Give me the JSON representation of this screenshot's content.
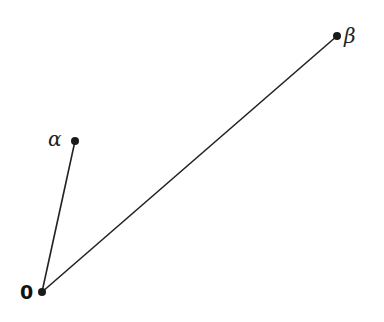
{
  "diagram": {
    "type": "vector-diagram",
    "stroke_color": "#222222",
    "points": {
      "origin": {
        "label": "0",
        "x": 42,
        "y": 292
      },
      "alpha": {
        "label": "α",
        "x": 75,
        "y": 141
      },
      "beta": {
        "label": "β",
        "x": 337,
        "y": 36
      }
    },
    "segments": [
      {
        "from": "origin",
        "to": "alpha"
      },
      {
        "from": "origin",
        "to": "beta"
      }
    ]
  }
}
